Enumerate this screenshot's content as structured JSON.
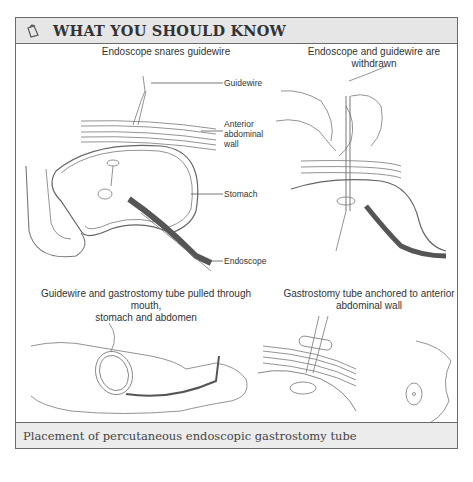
{
  "header": {
    "icon": "notepad-pencil-icon",
    "title": "WHAT YOU SHOULD KNOW"
  },
  "panels": [
    {
      "title": "Endoscope snares guidewire",
      "labels": [
        "Guidewire",
        "Anterior abdominal wall",
        "Stomach",
        "Endoscope"
      ]
    },
    {
      "title": "Endoscope and guidewire are withdrawn"
    },
    {
      "title_line1": "Guidewire and gastrostomy tube pulled through mouth,",
      "title_line2": "stomach and abdomen"
    },
    {
      "title_line1": "Gastrostomy tube anchored to anterior",
      "title_line2": "abdominal wall"
    }
  ],
  "labels": {
    "guidewire": "Guidewire",
    "anterior_l1": "Anterior",
    "anterior_l2": "abdominal",
    "anterior_l3": "wall",
    "stomach": "Stomach",
    "endoscope": "Endoscope"
  },
  "caption": "Placement of percutaneous endoscopic gastrostomy tube",
  "colors": {
    "header_bg": "#e6e6e6",
    "border": "#6a6a6a",
    "endoscope": "#555555"
  }
}
